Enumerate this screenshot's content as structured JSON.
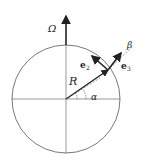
{
  "diagram": {
    "labels": {
      "omega": "Ω",
      "radius": "R",
      "alpha": "α",
      "beta": "β",
      "e2_base": "e",
      "e2_sub": "2",
      "e3_base": "e",
      "e3_sub": "3"
    },
    "colors": {
      "stroke": "#222222",
      "circle": "#555555",
      "background": "#ffffff"
    }
  }
}
